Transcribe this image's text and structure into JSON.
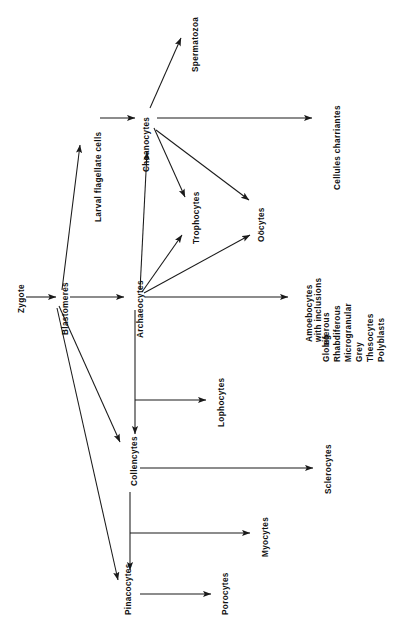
{
  "figure": {
    "orientation": "rotated-90-ccw",
    "background_color": "#ffffff",
    "line_color": "#1a1a1a",
    "text_color": "#111111"
  },
  "nodes": {
    "zygote": "Zygote",
    "blastomeres": "Blastomeres",
    "larval_flagellate_cells": "Larval flagellate cells",
    "choanocytes": "Choanocytes",
    "spermatozoa": "Spermatozoa",
    "cellules_charriantes": "Cellules charriantes",
    "trophocytes": "Trophocytes",
    "oocytes": "Oöcytes",
    "archaeocytes": "Archaeocytes",
    "lophocytes": "Lophocytes",
    "collencytes": "Collencytes",
    "sclerocytes": "Sclerocytes",
    "myocytes": "Myocytes",
    "pinacocytes": "Pinacocytes",
    "porocytes": "Porocytes"
  },
  "amoebocytes_group": {
    "heading_line_1": "Amoebocytes",
    "heading_line_2": "with  inclusions",
    "eg_prefix": "eg",
    "items": [
      "Globiferous",
      "Rhabdiferous",
      "Microgranular",
      "Grey",
      "Thesocytes",
      "Polyblasts"
    ]
  },
  "edges": [
    {
      "from": "zygote",
      "to": "blastomeres"
    },
    {
      "from": "blastomeres",
      "to": "larval_flagellate_cells"
    },
    {
      "from": "blastomeres",
      "to": "archaeocytes"
    },
    {
      "from": "blastomeres",
      "to": "collencytes"
    },
    {
      "from": "blastomeres",
      "to": "pinacocytes"
    },
    {
      "from": "larval_flagellate_cells",
      "to": "choanocytes"
    },
    {
      "from": "choanocytes",
      "to": "spermatozoa"
    },
    {
      "from": "choanocytes",
      "to": "cellules_charriantes"
    },
    {
      "from": "choanocytes",
      "to": "trophocytes"
    },
    {
      "from": "choanocytes",
      "to": "oocytes"
    },
    {
      "from": "archaeocytes",
      "to": "choanocytes"
    },
    {
      "from": "archaeocytes",
      "to": "trophocytes"
    },
    {
      "from": "archaeocytes",
      "to": "oocytes"
    },
    {
      "from": "archaeocytes",
      "to": "amoebocytes_group"
    },
    {
      "from": "archaeocytes",
      "to": "lophocytes"
    },
    {
      "from": "archaeocytes",
      "to": "collencytes"
    },
    {
      "from": "collencytes",
      "to": "sclerocytes"
    },
    {
      "from": "collencytes",
      "to": "myocytes"
    },
    {
      "from": "collencytes",
      "to": "pinacocytes"
    },
    {
      "from": "pinacocytes",
      "to": "porocytes"
    }
  ]
}
